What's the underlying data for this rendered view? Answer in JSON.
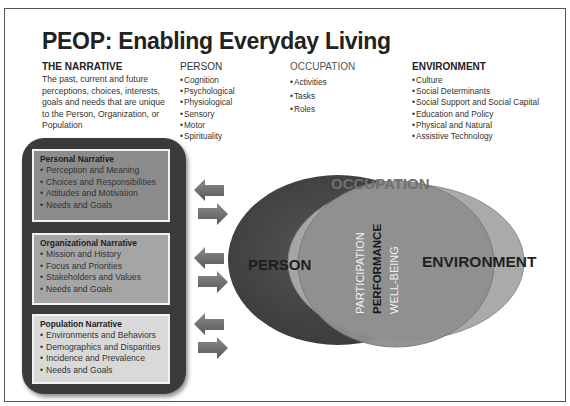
{
  "title": "PEOP: Enabling Everyday Living",
  "columns": {
    "narrative": {
      "heading": "THE NARRATIVE",
      "description_lines": [
        "The past, current and future",
        "perceptions, choices, interests,",
        "goals and needs that are unique",
        "to the Person, Organization, or",
        "Population"
      ]
    },
    "person": {
      "heading": "PERSON",
      "items": [
        "Cognition",
        "Psychological",
        "Physiological",
        "Sensory",
        "Motor",
        "Spirituality"
      ]
    },
    "occupation": {
      "heading": "OCCUPATION",
      "items": [
        "Activities",
        "Tasks",
        "Roles"
      ]
    },
    "environment": {
      "heading": "ENVIRONMENT",
      "items": [
        "Culture",
        "Social Determinants",
        "Social Support and Social Capital",
        "Education and Policy",
        "Physical and Natural",
        "Assistive Technology"
      ]
    }
  },
  "narratives": [
    {
      "title": "Personal Narrative",
      "items": [
        "Perception and Meaning",
        "Choices and Responsibilities",
        "Attitudes and Motivation",
        "Needs and Goals"
      ],
      "fill": "#8c8c8c"
    },
    {
      "title": "Organizational Narrative",
      "items": [
        "Mission and History",
        "Focus and Priorities",
        "Stakeholders and Values",
        "Needs and Goals"
      ],
      "fill": "#a5a5a5"
    },
    {
      "title": "Population Narrative",
      "items": [
        "Environments and Behaviors",
        "Demographics and Disparities",
        "Incidence and Prevalence",
        "Needs and Goals"
      ],
      "fill": "#d9d9d9"
    }
  ],
  "venn": {
    "person_label": "PERSON",
    "occupation_label": "OCCUPATION",
    "environment_label": "ENVIRONMENT",
    "outcomes": [
      "PARTICIPATION",
      "PERFORMANCE",
      "WELL-BEING"
    ],
    "colors": {
      "person": "#4a4a4a",
      "environment": "#a6a6a6",
      "occupation": "#8e8e8e",
      "occupation_label": "#6f6f6f"
    }
  },
  "icons": {
    "exchange_arrows": "bidirectional-arrows"
  }
}
